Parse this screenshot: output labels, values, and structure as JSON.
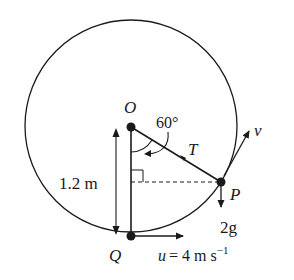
{
  "diagram": {
    "points": {
      "O": "O",
      "P": "P",
      "Q": "Q"
    },
    "labels": {
      "angle": "60°",
      "tension": "T",
      "velocity": "v",
      "weight": "2g",
      "length": "1.2 m",
      "initial_speed_var": "u",
      "initial_speed_eq": "= 4 m s",
      "initial_speed_exp": "−1"
    },
    "colors": {
      "stroke": "#1a1a1a",
      "background": "#ffffff"
    }
  }
}
